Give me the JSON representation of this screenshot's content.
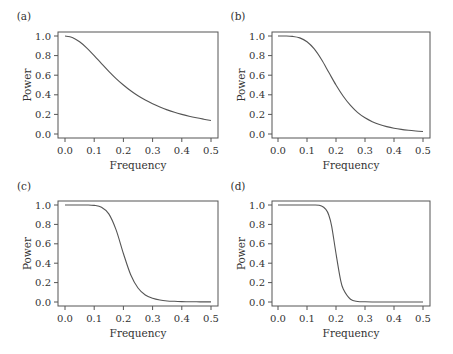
{
  "chart_data": [
    {
      "type": "line",
      "panel_label": "(a)",
      "title": "",
      "xlabel": "Frequency",
      "ylabel": "Power",
      "xlim": [
        0.0,
        0.5
      ],
      "ylim": [
        0.0,
        1.0
      ],
      "xticks": [
        "0.0",
        "0.1",
        "0.2",
        "0.3",
        "0.4",
        "0.5"
      ],
      "yticks": [
        "0.0",
        "0.2",
        "0.4",
        "0.6",
        "0.8",
        "1.0"
      ],
      "grid": false,
      "x": [
        0.0,
        0.025,
        0.05,
        0.075,
        0.1,
        0.125,
        0.15,
        0.175,
        0.2,
        0.225,
        0.25,
        0.275,
        0.3,
        0.325,
        0.35,
        0.375,
        0.4,
        0.425,
        0.45,
        0.475,
        0.5
      ],
      "series": [
        {
          "name": "",
          "values": [
            1.0,
            0.985,
            0.941,
            0.877,
            0.8,
            0.719,
            0.64,
            0.566,
            0.5,
            0.441,
            0.39,
            0.346,
            0.308,
            0.275,
            0.246,
            0.221,
            0.2,
            0.181,
            0.165,
            0.151,
            0.138
          ]
        }
      ]
    },
    {
      "type": "line",
      "panel_label": "(b)",
      "title": "",
      "xlabel": "Frequency",
      "ylabel": "Power",
      "xlim": [
        0.0,
        0.5
      ],
      "ylim": [
        0.0,
        1.0
      ],
      "xticks": [
        "0.0",
        "0.1",
        "0.2",
        "0.3",
        "0.4",
        "0.5"
      ],
      "yticks": [
        "0.0",
        "0.2",
        "0.4",
        "0.6",
        "0.8",
        "1.0"
      ],
      "grid": false,
      "x": [
        0.0,
        0.025,
        0.05,
        0.075,
        0.1,
        0.125,
        0.15,
        0.175,
        0.2,
        0.225,
        0.25,
        0.275,
        0.3,
        0.325,
        0.35,
        0.375,
        0.4,
        0.425,
        0.45,
        0.475,
        0.5
      ],
      "series": [
        {
          "name": "",
          "values": [
            1.0,
            1.0,
            0.996,
            0.981,
            0.941,
            0.868,
            0.76,
            0.63,
            0.5,
            0.385,
            0.291,
            0.218,
            0.165,
            0.126,
            0.096,
            0.075,
            0.059,
            0.047,
            0.038,
            0.031,
            0.025
          ]
        }
      ]
    },
    {
      "type": "line",
      "panel_label": "(c)",
      "title": "",
      "xlabel": "Frequency",
      "ylabel": "Power",
      "xlim": [
        0.0,
        0.5
      ],
      "ylim": [
        0.0,
        1.0
      ],
      "xticks": [
        "0.0",
        "0.1",
        "0.2",
        "0.3",
        "0.4",
        "0.5"
      ],
      "yticks": [
        "0.0",
        "0.2",
        "0.4",
        "0.6",
        "0.8",
        "1.0"
      ],
      "grid": false,
      "x": [
        0.0,
        0.025,
        0.05,
        0.075,
        0.1,
        0.125,
        0.15,
        0.175,
        0.2,
        0.225,
        0.25,
        0.275,
        0.3,
        0.325,
        0.35,
        0.375,
        0.4,
        0.425,
        0.45,
        0.475,
        0.5
      ],
      "series": [
        {
          "name": "",
          "values": [
            1.0,
            1.0,
            1.0,
            1.0,
            0.996,
            0.977,
            0.909,
            0.744,
            0.5,
            0.281,
            0.144,
            0.072,
            0.038,
            0.02,
            0.011,
            0.007,
            0.004,
            0.002,
            0.002,
            0.001,
            0.001
          ]
        }
      ]
    },
    {
      "type": "line",
      "panel_label": "(d)",
      "title": "",
      "xlabel": "Frequency",
      "ylabel": "Power",
      "xlim": [
        0.0,
        0.5
      ],
      "ylim": [
        0.0,
        1.0
      ],
      "xticks": [
        "0.0",
        "0.1",
        "0.2",
        "0.3",
        "0.4",
        "0.5"
      ],
      "yticks": [
        "0.0",
        "0.2",
        "0.4",
        "0.6",
        "0.8",
        "1.0"
      ],
      "grid": false,
      "x": [
        0.0,
        0.025,
        0.05,
        0.075,
        0.1,
        0.125,
        0.15,
        0.165,
        0.175,
        0.185,
        0.2,
        0.215,
        0.225,
        0.25,
        0.275,
        0.3,
        0.325,
        0.35,
        0.375,
        0.4,
        0.45,
        0.5
      ],
      "series": [
        {
          "name": "",
          "values": [
            1.0,
            1.0,
            1.0,
            1.0,
            1.0,
            1.0,
            0.99,
            0.954,
            0.897,
            0.783,
            0.5,
            0.239,
            0.134,
            0.028,
            0.006,
            0.002,
            0.0,
            0.0,
            0.0,
            0.0,
            0.0,
            0.0
          ]
        }
      ]
    }
  ]
}
